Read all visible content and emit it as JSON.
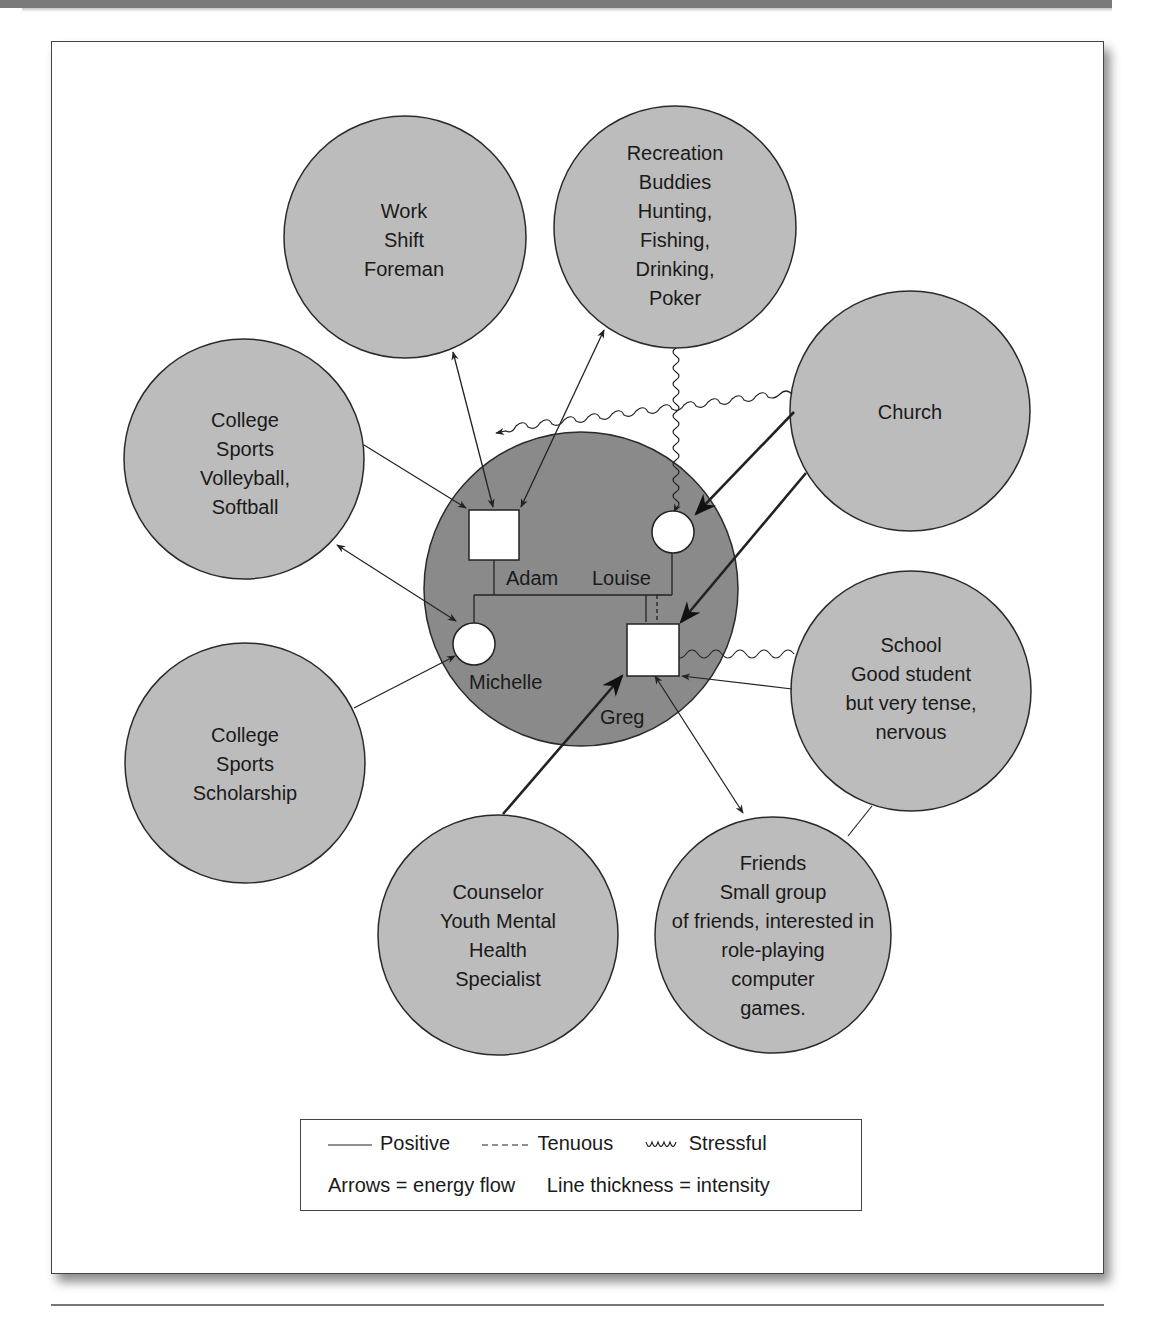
{
  "figure": {
    "colors": {
      "family_circle_fill": "#8a8a8a",
      "system_circle_fill": "#bcbcbc",
      "stroke": "#2a2a2a",
      "frame_border": "#444444",
      "top_band": "#7a7a7a"
    }
  },
  "family": {
    "members": [
      {
        "id": "adam",
        "name": "Adam",
        "shape": "square"
      },
      {
        "id": "louise",
        "name": "Louise",
        "shape": "circle"
      },
      {
        "id": "michelle",
        "name": "Michelle",
        "shape": "circle"
      },
      {
        "id": "greg",
        "name": "Greg",
        "shape": "square"
      }
    ]
  },
  "systems": [
    {
      "id": "work",
      "lines": [
        "Work",
        "Shift",
        "Foreman"
      ]
    },
    {
      "id": "recreation",
      "lines": [
        "Recreation",
        "Buddies",
        "Hunting,",
        "Fishing,",
        "Drinking,",
        "Poker"
      ]
    },
    {
      "id": "church",
      "lines": [
        "Church"
      ]
    },
    {
      "id": "college-sports-vb",
      "lines": [
        "College",
        "Sports",
        "Volleyball,",
        "Softball"
      ]
    },
    {
      "id": "college-sports-sch",
      "lines": [
        "College",
        "Sports",
        "Scholarship"
      ]
    },
    {
      "id": "school",
      "lines": [
        "School",
        "Good student",
        "but very tense,",
        "nervous"
      ]
    },
    {
      "id": "counselor",
      "lines": [
        "Counselor",
        "Youth Mental",
        "Health",
        "Specialist"
      ]
    },
    {
      "id": "friends",
      "lines": [
        "Friends",
        "Small group",
        "of friends, interested in",
        "role-playing",
        "computer",
        "games."
      ]
    }
  ],
  "connections": [
    {
      "from": "work",
      "to": "adam",
      "type": "positive",
      "arrows": "both",
      "thickness": "thin"
    },
    {
      "from": "recreation",
      "to": "adam",
      "type": "positive",
      "arrows": "both",
      "thickness": "thin"
    },
    {
      "from": "recreation",
      "to": "louise",
      "type": "stressful",
      "arrows": "to",
      "thickness": "thin"
    },
    {
      "from": "church",
      "to": "adam",
      "type": "stressful",
      "arrows": "to",
      "thickness": "thin"
    },
    {
      "from": "church",
      "to": "louise",
      "type": "positive",
      "arrows": "to",
      "thickness": "thick"
    },
    {
      "from": "church",
      "to": "greg",
      "type": "positive",
      "arrows": "to",
      "thickness": "thick"
    },
    {
      "from": "college-sports-vb",
      "to": "adam",
      "type": "positive",
      "arrows": "to",
      "thickness": "thin"
    },
    {
      "from": "college-sports-vb",
      "to": "michelle",
      "type": "positive",
      "arrows": "both",
      "thickness": "thin"
    },
    {
      "from": "college-sports-sch",
      "to": "michelle",
      "type": "positive",
      "arrows": "to",
      "thickness": "thin"
    },
    {
      "from": "school",
      "to": "greg",
      "type": "stressful",
      "arrows": "to",
      "thickness": "thin"
    },
    {
      "from": "school",
      "to": "greg",
      "type": "positive",
      "arrows": "to",
      "thickness": "thin"
    },
    {
      "from": "counselor",
      "to": "greg",
      "type": "positive",
      "arrows": "to",
      "thickness": "thick"
    },
    {
      "from": "friends",
      "to": "greg",
      "type": "positive",
      "arrows": "both",
      "thickness": "thin"
    },
    {
      "from": "school",
      "to": "friends",
      "type": "positive",
      "arrows": "none",
      "thickness": "thin"
    },
    {
      "from": "louise",
      "to": "greg",
      "type": "tenuous",
      "arrows": "none",
      "thickness": "thin"
    }
  ],
  "legend": {
    "positive_label": "Positive",
    "tenuous_label": "Tenuous",
    "stressful_label": "Stressful",
    "arrows_note": "Arrows = energy flow",
    "thickness_note": "Line thickness = intensity"
  }
}
